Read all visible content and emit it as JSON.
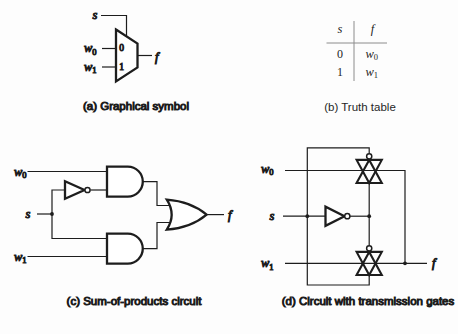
{
  "colors": {
    "line": "#1d1d1d",
    "rule": "#8c8c8c",
    "background": "#fdfdfd"
  },
  "panel_a": {
    "caption": "(a) Graphical symbol",
    "select_label": "s",
    "input0": {
      "base": "w",
      "sub": "0"
    },
    "input1": {
      "base": "w",
      "sub": "1"
    },
    "port0": "0",
    "port1": "1",
    "output_label": "f"
  },
  "panel_b": {
    "caption": "(b) Truth table",
    "header": {
      "s": "s",
      "f": "f"
    },
    "rows": [
      {
        "s": "0",
        "f_base": "w",
        "f_sub": "0"
      },
      {
        "s": "1",
        "f_base": "w",
        "f_sub": "1"
      }
    ]
  },
  "panel_c": {
    "caption": "(c) Sum-of-products circuit",
    "input_w0": {
      "base": "w",
      "sub": "0"
    },
    "select_label": "s",
    "input_w1": {
      "base": "w",
      "sub": "1"
    },
    "output_label": "f"
  },
  "panel_d": {
    "caption": "(d) Circuit with transmission gates",
    "input_w0": {
      "base": "w",
      "sub": "0"
    },
    "select_label": "s",
    "input_w1": {
      "base": "w",
      "sub": "1"
    },
    "output_label": "f"
  }
}
